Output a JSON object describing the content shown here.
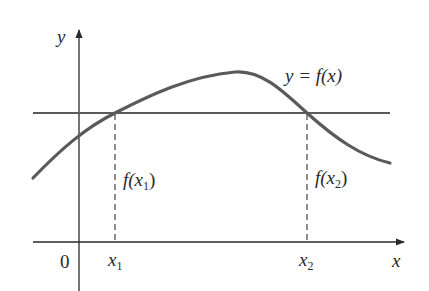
{
  "diagram": {
    "type": "function-graph",
    "axes": {
      "x_label": "x",
      "y_label": "y",
      "origin_label": "0"
    },
    "curve": {
      "label": "y = f(x)",
      "color": "#5a5a5a"
    },
    "horizontal_line": {
      "color": "#5a5a5a",
      "description": "horizontal line intersecting the curve at two points"
    },
    "points": [
      {
        "x_label": "x",
        "x_sub": "1",
        "value_label_prefix": "f(x",
        "value_label_sub": "1",
        "value_label_suffix": ")"
      },
      {
        "x_label": "x",
        "x_sub": "2",
        "value_label_prefix": "f(x",
        "value_label_sub": "2",
        "value_label_suffix": ")"
      }
    ],
    "colors": {
      "axis": "#2a2a2a",
      "text": "#2a2a2a",
      "dashed": "#444444"
    }
  }
}
